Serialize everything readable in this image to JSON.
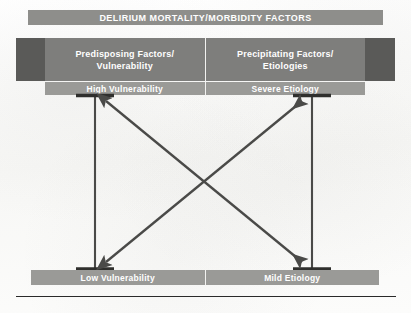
{
  "figure": {
    "title": "DELIRIUM MORTALITY/MORBIDITY FACTORS",
    "background_color": "#fbfbfa",
    "banner_color": "#8e8e8b",
    "header_color": "#7e7e7c",
    "subheader_color": "#9a9a97",
    "flank_color": "#5a5a58",
    "line_color": "#4a4a48",
    "text_color": "#ffffff"
  },
  "columns": [
    {
      "id": "predisposing",
      "header": "Predisposing Factors/\nVulnerability",
      "header_line1": "Predisposing Factors/",
      "header_line2": "Vulnerability",
      "top_label": "High Vulnerability",
      "bottom_label": "Low Vulnerability"
    },
    {
      "id": "precipitating",
      "header": "Precipitating Factors/\nEtiologies",
      "header_line1": "Precipitating Factors/",
      "header_line2": "Etiologies",
      "top_label": "Severe Etiology",
      "bottom_label": "Mild Etiology"
    }
  ],
  "axes": [
    {
      "id": "vulnerability-axis",
      "top_label": "High Vulnerability",
      "bottom_label": "Low Vulnerability"
    },
    {
      "id": "etiology-axis",
      "top_label": "Severe Etiology",
      "bottom_label": "Mild Etiology"
    }
  ],
  "arrows": [
    {
      "id": "high-vulnerability-to-mild-etiology",
      "from": "High Vulnerability",
      "to": "Mild Etiology",
      "style": "double-headed",
      "direction": "top-left to bottom-right"
    },
    {
      "id": "low-vulnerability-to-severe-etiology",
      "from": "Low Vulnerability",
      "to": "Severe Etiology",
      "style": "double-headed",
      "direction": "bottom-left to top-right"
    }
  ]
}
